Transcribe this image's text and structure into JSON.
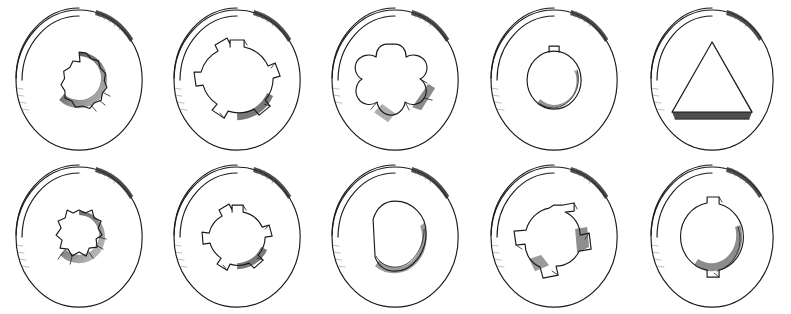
{
  "figure": {
    "background_color": "#ffffff",
    "ink_color": "#1a1a1a",
    "shade_color": "#4a4a4a",
    "rows": 2,
    "columns": 5,
    "total_items": 10,
    "canvas_width": 791,
    "canvas_height": 314
  },
  "items": [
    {
      "index": 1,
      "position": "row-1-col-1",
      "name": "twelve-point-bore",
      "bore_profile": "12-point scalloped spline",
      "tooth_count": 12,
      "outer_radius_px": 74,
      "bore_radius_px": 28,
      "rim_visible": true,
      "shaded_quadrant": "lower-right"
    },
    {
      "index": 2,
      "position": "row-1-col-2",
      "name": "four-keyway-bore",
      "bore_profile": "round bore with four square keyways",
      "tooth_count": 4,
      "outer_radius_px": 74,
      "bore_radius_px": 33,
      "rim_visible": true,
      "shaded_quadrant": "lower-right"
    },
    {
      "index": 3,
      "position": "row-1-col-3",
      "name": "five-lobe-star-bore",
      "bore_profile": "five-lobe Torx star",
      "tooth_count": 5,
      "outer_radius_px": 74,
      "bore_radius_px": 36,
      "rim_visible": true,
      "shaded_quadrant": "lower-right"
    },
    {
      "index": 4,
      "position": "row-1-col-4",
      "name": "single-keyway-bore",
      "bore_profile": "round bore with one top keyway",
      "tooth_count": 1,
      "outer_radius_px": 74,
      "bore_radius_px": 27,
      "rim_visible": true,
      "shaded_quadrant": "lower-right"
    },
    {
      "index": 5,
      "position": "row-1-col-5",
      "name": "triangular-bore",
      "bore_profile": "equilateral triangular bore",
      "tooth_count": 3,
      "outer_radius_px": 72,
      "bore_radius_px": 44,
      "rim_visible": true,
      "shaded_quadrant": "bottom-edge"
    },
    {
      "index": 6,
      "position": "row-2-col-1",
      "name": "eight-tooth-spline-bore",
      "bore_profile": "eight-tooth involute spline",
      "tooth_count": 8,
      "outer_radius_px": 74,
      "bore_radius_px": 27,
      "rim_visible": true,
      "shaded_quadrant": "lower-right"
    },
    {
      "index": 7,
      "position": "row-2-col-2",
      "name": "four-keyway-small-bore",
      "bore_profile": "small round bore with four square keyways",
      "tooth_count": 4,
      "outer_radius_px": 74,
      "bore_radius_px": 26,
      "rim_visible": true,
      "shaded_quadrant": "lower-right"
    },
    {
      "index": 8,
      "position": "row-2-col-3",
      "name": "d-shaped-bore",
      "bore_profile": "D-shaped bore with single flat",
      "tooth_count": 1,
      "outer_radius_px": 74,
      "bore_radius_px": 36,
      "rim_visible": true,
      "shaded_quadrant": "lower-right"
    },
    {
      "index": 9,
      "position": "row-2-col-4",
      "name": "tri-wing-bore",
      "bore_profile": "tri-wing bore with three tangential slots",
      "tooth_count": 3,
      "outer_radius_px": 74,
      "bore_radius_px": 30,
      "rim_visible": true,
      "shaded_quadrant": "lower-right"
    },
    {
      "index": 10,
      "position": "row-2-col-5",
      "name": "two-keyway-bore",
      "bore_profile": "round bore with two opposed keyways",
      "tooth_count": 2,
      "outer_radius_px": 72,
      "bore_radius_px": 34,
      "rim_visible": true,
      "shaded_quadrant": "lower-right"
    }
  ]
}
